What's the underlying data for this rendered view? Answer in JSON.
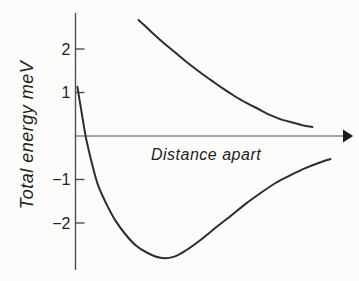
{
  "figure": {
    "background": "#fcfcfa",
    "curve_color": "#2d2d2d",
    "axis_color": "#4f4f4f"
  },
  "chart_data": {
    "type": "line",
    "title": "",
    "xlabel": "Distance apart",
    "ylabel": "Total energy meV",
    "x_units": "arbitrary units 0-100 (x axis unlabeled, arrow to the right)",
    "y_units": "meV",
    "ylim": [
      -3,
      3
    ],
    "yticks": [
      2,
      1,
      -1,
      -2
    ],
    "x_axis_arrow": true,
    "grid": false,
    "legend": "none",
    "series": [
      {
        "name": "upper repulsive curve (no bonding)",
        "x": [
          23.1,
          27.5,
          31.9,
          36.3,
          40.7,
          45.1,
          49.5,
          53.8,
          58.2,
          62.6,
          67.0,
          71.4,
          75.8,
          80.2,
          83.5,
          86.8
        ],
        "y": [
          2.67,
          2.41,
          2.16,
          1.93,
          1.7,
          1.49,
          1.29,
          1.1,
          0.92,
          0.76,
          0.62,
          0.48,
          0.37,
          0.3,
          0.24,
          0.21
        ]
      },
      {
        "name": "lower bonding curve (potential well)",
        "x": [
          0.7,
          1.8,
          3.3,
          4.0,
          5.9,
          8.1,
          11.0,
          14.3,
          17.9,
          22.0,
          26.4,
          31.1,
          35.9,
          40.7,
          45.8,
          51.3,
          56.8,
          62.3,
          67.8,
          73.3,
          78.8,
          84.2,
          89.0,
          93.4
        ],
        "y": [
          1.13,
          0.71,
          0.14,
          -0.09,
          -0.6,
          -1.1,
          -1.52,
          -1.91,
          -2.23,
          -2.51,
          -2.69,
          -2.8,
          -2.78,
          -2.62,
          -2.39,
          -2.11,
          -1.84,
          -1.56,
          -1.31,
          -1.08,
          -0.9,
          -0.74,
          -0.62,
          -0.53
        ],
        "minimum_meV": -2.8
      }
    ]
  }
}
